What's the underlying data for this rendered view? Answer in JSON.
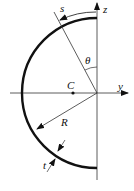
{
  "diagram": {
    "labels": {
      "s": "s",
      "z": "z",
      "theta": "θ",
      "C": "C",
      "y": "y",
      "R": "R",
      "t": "t"
    },
    "colors": {
      "stroke": "#111111",
      "background": "#ffffff"
    }
  }
}
